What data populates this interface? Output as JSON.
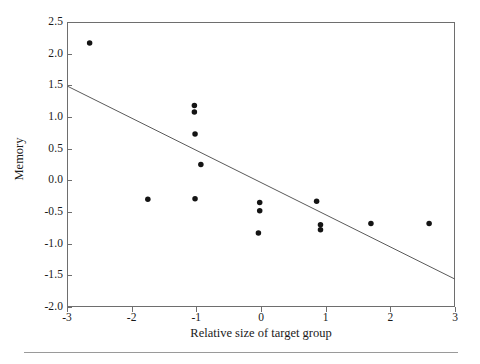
{
  "chart_data": {
    "type": "scatter",
    "title": "",
    "xlabel": "Relative size of target group",
    "ylabel": "Memory",
    "xlim": [
      -3,
      3
    ],
    "ylim": [
      -2.0,
      2.5
    ],
    "xticks": [
      -3,
      -2,
      -1,
      0,
      1,
      2,
      3
    ],
    "xtick_labels": [
      "-3",
      "-2",
      "-1",
      "0",
      "1",
      "2",
      "3"
    ],
    "yticks": [
      -2.0,
      -1.5,
      -1.0,
      -0.5,
      0.0,
      0.5,
      1.0,
      1.5,
      2.0,
      2.5
    ],
    "ytick_labels": [
      "-2.0",
      "-1.5",
      "-1.0",
      "-0.5",
      "0.0",
      "0.5",
      "1.0",
      "1.5",
      "2.0",
      "2.5"
    ],
    "grid": false,
    "legend": null,
    "legend_position": "none",
    "marker_color": "#141414",
    "marker_shape": "circle",
    "marker_size": 4,
    "points": [
      {
        "x": -2.65,
        "y": 2.17
      },
      {
        "x": -1.03,
        "y": 1.18
      },
      {
        "x": -1.03,
        "y": 1.08
      },
      {
        "x": -1.02,
        "y": 0.73
      },
      {
        "x": -0.93,
        "y": 0.25
      },
      {
        "x": -1.75,
        "y": -0.3
      },
      {
        "x": -1.02,
        "y": -0.29
      },
      {
        "x": -0.02,
        "y": -0.35
      },
      {
        "x": -0.02,
        "y": -0.48
      },
      {
        "x": -0.04,
        "y": -0.83
      },
      {
        "x": 0.86,
        "y": -0.33
      },
      {
        "x": 0.92,
        "y": -0.7
      },
      {
        "x": 0.92,
        "y": -0.78
      },
      {
        "x": 1.7,
        "y": -0.68
      },
      {
        "x": 2.6,
        "y": -0.68
      }
    ],
    "trend_line": {
      "type": "linear-fit",
      "x_start": -3.0,
      "y_start": 1.49,
      "x_end": 3.0,
      "y_end": -1.56,
      "color": "#5a5a5a"
    }
  }
}
